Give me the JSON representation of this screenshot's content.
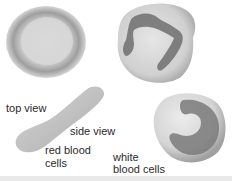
{
  "diagram": {
    "labels": {
      "top_view": "top view",
      "side_view": "side view",
      "red_blood_cells_line1": "red blood",
      "red_blood_cells_line2": "cells",
      "white_blood_cells_line1": "white",
      "white_blood_cells_line2": "blood cells"
    },
    "colors": {
      "cell_fill": "#c8c8c8",
      "cell_dark": "#8a8a8a",
      "nucleus": "#6e6e6e",
      "text": "#2a2a2a"
    }
  }
}
